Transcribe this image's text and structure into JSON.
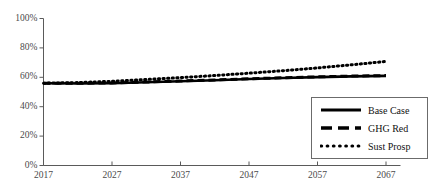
{
  "chart_data": {
    "type": "line",
    "title": "",
    "xlabel": "",
    "ylabel": "",
    "xlim": [
      2017,
      2070
    ],
    "ylim": [
      0,
      100
    ],
    "yunit": "%",
    "grid": false,
    "legend_position": "lower-right",
    "xticks": [
      "2017",
      "2027",
      "2037",
      "2047",
      "2057",
      "2067"
    ],
    "xtick_values": [
      2017,
      2027,
      2037,
      2047,
      2057,
      2067
    ],
    "yticks": [
      "0%",
      "20%",
      "40%",
      "60%",
      "80%",
      "100%"
    ],
    "ytick_values": [
      0,
      20,
      40,
      60,
      80,
      100
    ],
    "x": [
      2017,
      2022,
      2027,
      2032,
      2037,
      2042,
      2047,
      2052,
      2057,
      2062,
      2067
    ],
    "series": [
      {
        "name": "Base Case",
        "style": "solid",
        "color": "#000000",
        "values": [
          56.0,
          55.8,
          56.0,
          56.6,
          57.3,
          58.0,
          58.8,
          59.5,
          60.1,
          60.6,
          61.0
        ]
      },
      {
        "name": "GHG Red",
        "style": "dashed",
        "color": "#000000",
        "values": [
          56.0,
          55.9,
          56.2,
          56.8,
          57.5,
          58.2,
          59.0,
          59.7,
          60.3,
          60.8,
          61.2
        ]
      },
      {
        "name": "Sust Prosp",
        "style": "dotted",
        "color": "#000000",
        "values": [
          56.0,
          56.4,
          57.3,
          58.5,
          59.8,
          61.2,
          62.8,
          64.5,
          66.4,
          68.5,
          70.8
        ]
      }
    ]
  },
  "axes": {
    "axis_color": "#5a5a5a",
    "tick_color": "#5a5a5a"
  },
  "legend": {
    "entries": [
      {
        "label": "Base Case",
        "style": "solid"
      },
      {
        "label": "GHG Red",
        "style": "dashed"
      },
      {
        "label": "Sust Prosp",
        "style": "dotted"
      }
    ]
  }
}
